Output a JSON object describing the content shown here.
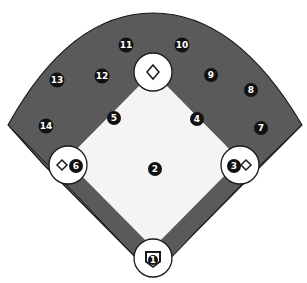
{
  "diagram": {
    "colors": {
      "outfield": "#5a5a5a",
      "infield": "#f4f4f4",
      "base_circle": "#ffffff",
      "outline": "#1a1a1a",
      "marker": "#111111",
      "marker_text": "#ffffff"
    },
    "bases": [
      {
        "name": "second-base",
        "cx": 153,
        "cy": 72,
        "icon": "diamond"
      },
      {
        "name": "first-base",
        "cx": 240,
        "cy": 165,
        "icon": "diamond"
      },
      {
        "name": "third-base",
        "cx": 68,
        "cy": 165,
        "icon": "diamond"
      },
      {
        "name": "home-plate",
        "cx": 153,
        "cy": 258,
        "icon": "home-plate"
      }
    ],
    "markers": [
      {
        "label": "1",
        "x": 153,
        "y": 260
      },
      {
        "label": "2",
        "x": 155,
        "y": 169
      },
      {
        "label": "3",
        "x": 234,
        "y": 166
      },
      {
        "label": "4",
        "x": 197,
        "y": 119
      },
      {
        "label": "5",
        "x": 114,
        "y": 118
      },
      {
        "label": "6",
        "x": 76,
        "y": 166
      },
      {
        "label": "7",
        "x": 261,
        "y": 128
      },
      {
        "label": "8",
        "x": 251,
        "y": 90
      },
      {
        "label": "9",
        "x": 211,
        "y": 75
      },
      {
        "label": "10",
        "x": 182,
        "y": 45
      },
      {
        "label": "11",
        "x": 126,
        "y": 45
      },
      {
        "label": "12",
        "x": 102,
        "y": 76
      },
      {
        "label": "13",
        "x": 57,
        "y": 80
      },
      {
        "label": "14",
        "x": 46,
        "y": 126
      }
    ]
  }
}
